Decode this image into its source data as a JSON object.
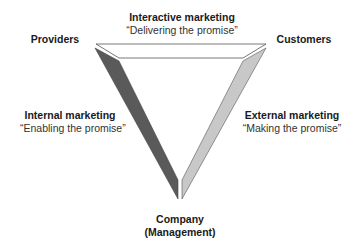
{
  "diagram": {
    "type": "services-marketing-triangle",
    "nodes": {
      "providers": "Providers",
      "customers": "Customers",
      "company_line1": "Company",
      "company_line2": "(Management)"
    },
    "edges": {
      "interactive": {
        "title": "Interactive marketing",
        "quote": "“Delivering the promise”"
      },
      "internal": {
        "title": "Internal marketing",
        "quote": "“Enabling the promise”"
      },
      "external": {
        "title": "External marketing",
        "quote": "“Making the promise”"
      }
    },
    "colors": {
      "top_band": "#ffffff",
      "left_band": "#5a5a5a",
      "right_band": "#c8c8c8",
      "outline": "#555555"
    }
  }
}
